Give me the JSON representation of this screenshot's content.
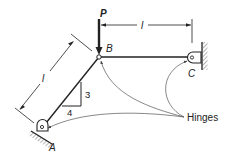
{
  "diagram": {
    "type": "structural-truss",
    "labels": {
      "load": "P",
      "joint_b": "B",
      "joint_c": "C",
      "joint_a": "A",
      "dim_horizontal": "l",
      "dim_diagonal": "l",
      "slope_rise": "3",
      "slope_run": "4",
      "hinges": "Hinges"
    },
    "colors": {
      "ink": "#222222",
      "leader": "#555555",
      "background": "#ffffff"
    }
  }
}
